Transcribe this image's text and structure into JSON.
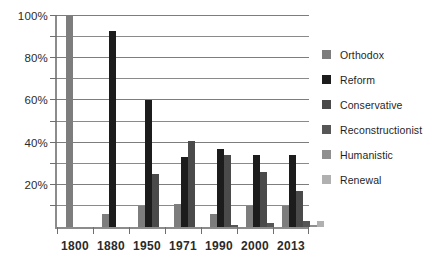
{
  "chart_data": {
    "type": "bar",
    "title": "",
    "subtitle": "",
    "xlabel": "",
    "ylabel": "",
    "categories": [
      "1800",
      "1880",
      "1950",
      "1971",
      "1990",
      "2000",
      "2013"
    ],
    "ylim": [
      0,
      100
    ],
    "y_tick_labels": [
      "20%",
      "40%",
      "60%",
      "80%",
      "100%"
    ],
    "y_tick_values": [
      20,
      40,
      60,
      80,
      100
    ],
    "y_minor_tick_values": [
      10,
      30,
      50,
      70,
      90
    ],
    "y_axis_unit": "%",
    "grid": "horizontal",
    "legend_position": "right",
    "series": [
      {
        "name": "Orthodox",
        "color": "#7d7d7d",
        "values": [
          100,
          6,
          10,
          11,
          6,
          10,
          10
        ]
      },
      {
        "name": "Reform",
        "color": "#1c1c1c",
        "values": [
          0,
          93,
          60,
          33,
          37,
          34,
          34
        ]
      },
      {
        "name": "Conservative",
        "color": "#4a4a4a",
        "values": [
          0,
          0,
          25,
          41,
          34,
          26,
          17
        ]
      },
      {
        "name": "Reconstructionist",
        "color": "#565656",
        "values": [
          0,
          0,
          0,
          0,
          1,
          2,
          3
        ]
      },
      {
        "name": "Humanistic",
        "color": "#8f8f8f",
        "values": [
          0,
          0,
          0,
          0,
          0,
          0,
          1
        ]
      },
      {
        "name": "Renewal",
        "color": "#b0b0b0",
        "values": [
          0,
          0,
          0,
          0,
          0,
          0,
          3
        ]
      }
    ]
  },
  "axis": {
    "axis_color": "#8c8c8c",
    "grid_color": "#8a8a8a",
    "tick_color": "#6f6f6f",
    "text_color": "#2b2b2b"
  }
}
